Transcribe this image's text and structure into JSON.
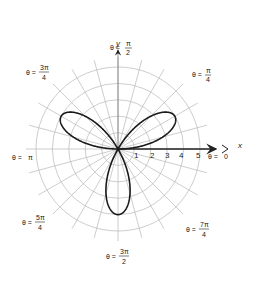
{
  "figure": {
    "curve": {
      "equation": "r = 4 sin(3θ)",
      "amplitude": 4,
      "k": 3,
      "color": "#1a1a1a"
    },
    "axes": {
      "x_label": "x",
      "y_label": "y"
    },
    "grid": {
      "rings": [
        1,
        2,
        3,
        4,
        5
      ],
      "spoke_step_deg": 15,
      "grid_color": "#b8b8b8"
    },
    "radial_tick_labels": [
      "1",
      "2",
      "3",
      "4",
      "5"
    ],
    "angle_labels": {
      "zero": {
        "prefix": "θ =",
        "value": "0"
      },
      "pi_over_4": {
        "prefix": "θ =",
        "num": "π",
        "den": "4"
      },
      "pi_over_2": {
        "prefix": "θ =",
        "num": "π",
        "den": "2"
      },
      "three_pi_over_4": {
        "prefix": "θ =",
        "num": "3π",
        "den": "4"
      },
      "pi": {
        "prefix": "θ =",
        "value": "π"
      },
      "five_pi_over_4": {
        "prefix": "θ =",
        "num": "5π",
        "den": "4"
      },
      "three_pi_over_2": {
        "prefix": "θ =",
        "num": "3π",
        "den": "2"
      },
      "seven_pi_over_4": {
        "prefix": "θ =",
        "num": "7π",
        "den": "4"
      }
    }
  }
}
